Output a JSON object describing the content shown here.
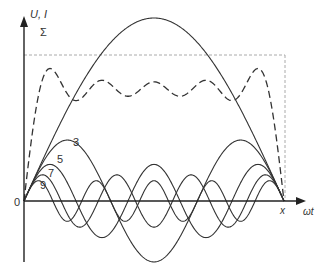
{
  "diagram": {
    "axes": {
      "y_label": "U, I",
      "x_label": "ωt",
      "origin_label": "0",
      "end_label": "x"
    },
    "sum_label": "Σ",
    "harmonic_labels": [
      "3",
      "5",
      "7",
      "9"
    ],
    "colors": {
      "curve": "#333333",
      "axis": "#222222",
      "reference": "#aaaaaa",
      "background": "#ffffff"
    }
  },
  "chart_data": {
    "type": "line",
    "xlabel": "ωt",
    "ylabel": "U, I",
    "x_range": [
      0,
      "π"
    ],
    "series": [
      {
        "name": "1 (fundamental)",
        "harmonic": 1,
        "relative_amplitude": 1.0,
        "style": "solid"
      },
      {
        "name": "3",
        "harmonic": 3,
        "relative_amplitude": 0.333,
        "style": "solid"
      },
      {
        "name": "5",
        "harmonic": 5,
        "relative_amplitude": 0.2,
        "style": "solid"
      },
      {
        "name": "7",
        "harmonic": 7,
        "relative_amplitude": 0.143,
        "style": "solid"
      },
      {
        "name": "9",
        "harmonic": 9,
        "relative_amplitude": 0.111,
        "style": "solid"
      },
      {
        "name": "Σ",
        "description": "sum of harmonics 1,3,5,7,9",
        "style": "dashed"
      }
    ],
    "reference_level": "square wave amplitude (dotted horizontal line)",
    "grid": false
  }
}
